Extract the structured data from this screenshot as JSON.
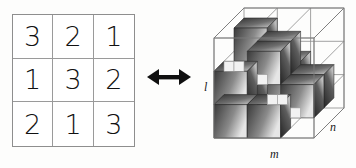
{
  "figure": {
    "arrow_symbol": "double-headed-arrow"
  },
  "latin_square": {
    "rows": [
      [
        "3",
        "2",
        "1"
      ],
      [
        "1",
        "3",
        "2"
      ],
      [
        "2",
        "1",
        "3"
      ]
    ],
    "order": 3
  },
  "cube": {
    "axes": {
      "l": "l",
      "m": "m",
      "n": "n"
    },
    "dimensions": [
      3,
      3,
      3
    ],
    "filled_cells": [
      {
        "row": 0,
        "col": 0,
        "height": 3
      },
      {
        "row": 0,
        "col": 1,
        "height": 2
      },
      {
        "row": 0,
        "col": 2,
        "height": 1
      },
      {
        "row": 1,
        "col": 0,
        "height": 1
      },
      {
        "row": 1,
        "col": 1,
        "height": 3
      },
      {
        "row": 1,
        "col": 2,
        "height": 2
      },
      {
        "row": 2,
        "col": 0,
        "height": 2
      },
      {
        "row": 2,
        "col": 1,
        "height": 1
      },
      {
        "row": 2,
        "col": 2,
        "height": 3
      }
    ]
  },
  "colors": {
    "background": "#fdfdfc",
    "grid_line": "#9a9a9a",
    "digit": "#111111",
    "arrow": "#101010",
    "wireframe": "#8a8a8a",
    "cube_dark": "#3a3a3a",
    "cube_light": "#e8e8e8"
  }
}
